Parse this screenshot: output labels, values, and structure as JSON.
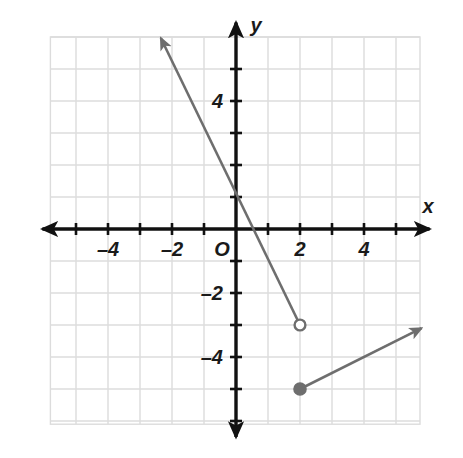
{
  "figure": {
    "kind": "coordinate-plane-graph",
    "background": "#ffffff",
    "grid_color": "#dcdcdc",
    "axis_color": "#111111",
    "curve_color": "#6e6e6e"
  },
  "axes": {
    "x_label": "x",
    "y_label": "y",
    "origin_label": "O",
    "x_ticks": [
      -5,
      -4,
      -3,
      -2,
      -1,
      1,
      2,
      3,
      4,
      5
    ],
    "y_ticks": [
      -6,
      -5,
      -4,
      -3,
      -2,
      -1,
      1,
      2,
      3,
      4,
      5
    ],
    "x_tick_labels": [
      {
        "value": -4,
        "text": "–4"
      },
      {
        "value": -2,
        "text": "–2"
      },
      {
        "value": 2,
        "text": "2"
      },
      {
        "value": 4,
        "text": "4"
      }
    ],
    "y_tick_labels": [
      {
        "value": 4,
        "text": "4"
      },
      {
        "value": -2,
        "text": "–2"
      },
      {
        "value": -4,
        "text": "–4"
      }
    ],
    "x_range": [
      -5.8,
      5.75
    ],
    "y_range": [
      -6.1,
      6.0
    ],
    "arrowheads": [
      "x-positive",
      "x-negative",
      "y-positive",
      "y-negative"
    ]
  },
  "chart_data": {
    "type": "line",
    "title": "",
    "xlabel": "x",
    "ylabel": "y",
    "xlim": [
      -5.8,
      5.75
    ],
    "ylim": [
      -6.1,
      6.0
    ],
    "grid": true,
    "legend": "none",
    "series": [
      {
        "name": "steep-decreasing-ray",
        "slope": -2,
        "y_intercept": 1,
        "equation": "y = -2x + 1",
        "endpoint": {
          "x": 2,
          "y": -3,
          "marker": "open-circle",
          "included": false
        },
        "direction": "up-left",
        "arrow_tip": {
          "x": -2.35,
          "y": 5.97
        },
        "points": [
          [
            -2.35,
            5.97
          ],
          [
            0,
            1
          ],
          [
            2,
            -3
          ]
        ]
      },
      {
        "name": "shallow-increasing-ray",
        "slope": 0.5,
        "equation": "y = 0.5x - 6",
        "endpoint": {
          "x": 2,
          "y": -5,
          "marker": "filled-circle",
          "included": true
        },
        "direction": "up-right",
        "arrow_tip": {
          "x": 5.8,
          "y": -3.1
        },
        "points": [
          [
            2,
            -5
          ],
          [
            5.8,
            -3.1
          ]
        ]
      }
    ],
    "markers": [
      {
        "x": 2,
        "y": -3,
        "style": "open",
        "color": "#6e6e6e"
      },
      {
        "x": 2,
        "y": -5,
        "style": "filled",
        "color": "#6e6e6e"
      }
    ]
  }
}
